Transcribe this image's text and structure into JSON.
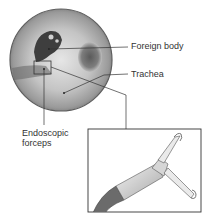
{
  "diagram": {
    "type": "medical-illustration",
    "labels": {
      "foreign_body": "Foreign body",
      "trachea": "Trachea",
      "forceps_line1": "Endoscopic",
      "forceps_line2": "forceps"
    },
    "colors": {
      "scope_rim": "#6a6a6a",
      "scope_fill": "#b8b8b8",
      "leader_line": "#333333",
      "inset_border": "#333333"
    }
  }
}
